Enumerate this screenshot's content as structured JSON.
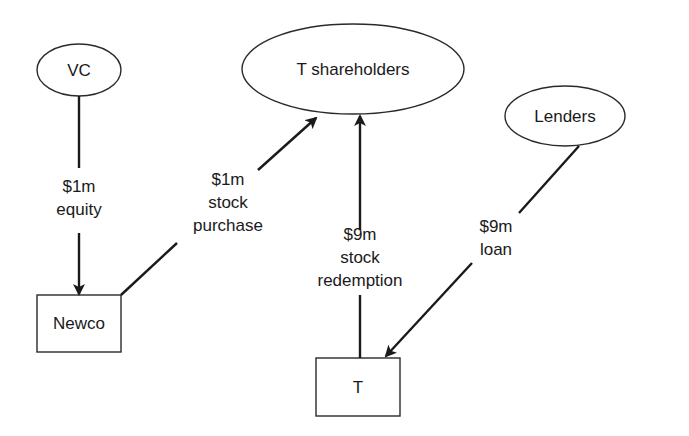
{
  "diagram": {
    "type": "flow-of-funds",
    "nodes": [
      {
        "id": "vc",
        "label": "VC",
        "shape": "ellipse"
      },
      {
        "id": "t_shareholders",
        "label": "T shareholders",
        "shape": "ellipse"
      },
      {
        "id": "lenders",
        "label": "Lenders",
        "shape": "ellipse"
      },
      {
        "id": "newco",
        "label": "Newco",
        "shape": "rectangle"
      },
      {
        "id": "t",
        "label": "T",
        "shape": "rectangle"
      }
    ],
    "edges": [
      {
        "from": "vc",
        "to": "newco",
        "label_lines": [
          "$1m",
          "equity"
        ]
      },
      {
        "from": "newco",
        "to": "t_shareholders",
        "label_lines": [
          "$1m",
          "stock",
          "purchase"
        ]
      },
      {
        "from": "t",
        "to": "t_shareholders",
        "label_lines": [
          "$9m",
          "stock",
          "redemption"
        ]
      },
      {
        "from": "lenders",
        "to": "t",
        "label_lines": [
          "$9m",
          "loan"
        ]
      }
    ]
  },
  "colors": {
    "background": "#ffffff",
    "ink": "#1a1a1a"
  }
}
